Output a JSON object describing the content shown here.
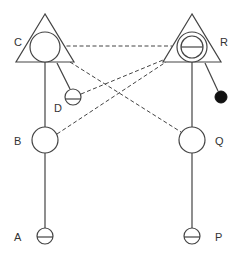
{
  "diagram": {
    "type": "pedigree-like node diagram",
    "colors": {
      "stroke": "#444444",
      "filled_node": "#111111",
      "background": "#ffffff",
      "label": "#333333"
    },
    "nodes": [
      {
        "id": "C",
        "label": "C",
        "shape": "circle-in-triangle",
        "cx": 45,
        "cy": 47,
        "r": 15
      },
      {
        "id": "R",
        "label": "R",
        "shape": "double-circle-with-bar-in-triangle",
        "cx": 192,
        "cy": 47,
        "r": 15
      },
      {
        "id": "D",
        "label": "D",
        "shape": "small-circle-with-bar",
        "cx": 73,
        "cy": 97,
        "r": 8
      },
      {
        "id": "filled",
        "label": "",
        "shape": "filled-dot",
        "cx": 221,
        "cy": 97,
        "r": 6
      },
      {
        "id": "B",
        "label": "B",
        "shape": "circle",
        "cx": 45,
        "cy": 140,
        "r": 13
      },
      {
        "id": "Q",
        "label": "Q",
        "shape": "circle",
        "cx": 192,
        "cy": 140,
        "r": 13
      },
      {
        "id": "A",
        "label": "A",
        "shape": "small-circle-with-bar",
        "cx": 45,
        "cy": 236,
        "r": 8
      },
      {
        "id": "P",
        "label": "P",
        "shape": "small-circle-with-bar",
        "cx": 192,
        "cy": 236,
        "r": 8
      }
    ],
    "solid_edges": [
      {
        "from": "C",
        "to": "B"
      },
      {
        "from": "B",
        "to": "A"
      },
      {
        "from": "C",
        "to": "D"
      },
      {
        "from": "R",
        "to": "Q"
      },
      {
        "from": "Q",
        "to": "P"
      },
      {
        "from": "R",
        "to": "filled"
      }
    ],
    "dashed_edges": [
      {
        "from": "C",
        "to": "R"
      },
      {
        "from": "C",
        "to": "Q"
      },
      {
        "from": "D",
        "to": "R"
      },
      {
        "from": "B",
        "to": "R"
      }
    ]
  }
}
